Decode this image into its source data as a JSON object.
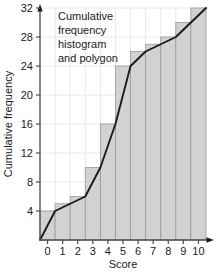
{
  "chart_data": {
    "type": "bar",
    "title": "",
    "annotation": "Cumulative frequency histogram and polygon",
    "annotation_lines": [
      "Cumulative",
      "frequency",
      "histogram",
      "and polygon"
    ],
    "xlabel": "Score",
    "ylabel": "Cumulative frequency",
    "categories": [
      "0",
      "1",
      "2",
      "3",
      "4",
      "5",
      "6",
      "7",
      "8",
      "9",
      "10"
    ],
    "values": [
      4,
      5,
      6,
      10,
      16,
      24,
      26,
      27,
      28,
      30,
      32
    ],
    "xlim": [
      -0.5,
      10.5
    ],
    "ylim": [
      0,
      32
    ],
    "xticks": [
      "0",
      "1",
      "2",
      "3",
      "4",
      "5",
      "6",
      "7",
      "8",
      "9",
      "10"
    ],
    "yticks": [
      "4",
      "8",
      "12",
      "16",
      "20",
      "24",
      "28",
      "32"
    ],
    "ytick_values": [
      4,
      8,
      12,
      16,
      20,
      24,
      28,
      32
    ],
    "grid": true,
    "legend": "none",
    "series": [
      {
        "name": "Cumulative frequency histogram",
        "kind": "bar",
        "values": [
          4,
          5,
          6,
          10,
          16,
          24,
          26,
          27,
          28,
          30,
          32
        ]
      },
      {
        "name": "Cumulative frequency polygon",
        "kind": "line",
        "x": [
          -0.5,
          0.5,
          1.5,
          2.5,
          3.5,
          4.5,
          5.5,
          6.5,
          7.5,
          8.5,
          9.5,
          10.5
        ],
        "y": [
          0,
          4,
          5,
          6,
          10,
          16,
          24,
          26,
          27,
          28,
          30,
          32
        ]
      }
    ],
    "colors": {
      "bar_fill": "#d2d2d2",
      "bar_edge": "#9a9a9a",
      "line": "#1a1a1a",
      "axis": "#4d4d4d",
      "grid": "#e8e8e8",
      "text": "#1a1a1a"
    }
  }
}
